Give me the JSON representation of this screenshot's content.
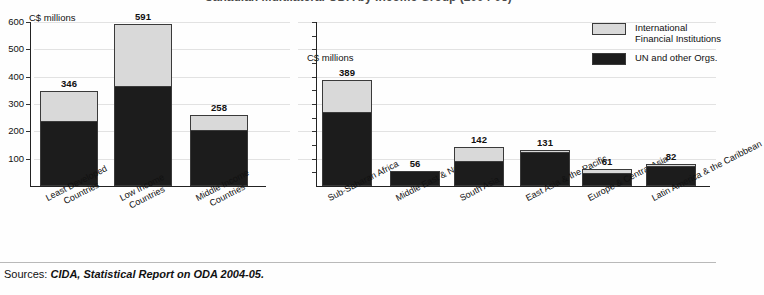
{
  "figure": {
    "title_cut_off": "Canadian Multilateral ODA by Income Group (2004-05)",
    "source_label": "Sources:",
    "source_reference": "CIDA, Statistical Report on ODA 2004-05."
  },
  "legend": {
    "position": "top-right",
    "items": [
      {
        "label_line1": "International",
        "label_line2": "Financial Institutions",
        "color": "#d9d9d9",
        "name": "international-financial-institutions"
      },
      {
        "label_line1": "UN and other Orgs.",
        "label_line2": "",
        "color": "#1c1c1c",
        "name": "un-and-other-orgs"
      }
    ]
  },
  "chart_data": [
    {
      "id": "income-group",
      "type": "bar",
      "stacked": true,
      "title": "",
      "xlabel": "",
      "ylabel": "C$ millions",
      "axis_unit": "C$ millions",
      "ylim": [
        0,
        600
      ],
      "yticks": [
        100,
        200,
        300,
        400,
        500,
        600
      ],
      "ytick_labels": [
        "100",
        "200",
        "300",
        "400",
        "500",
        "600"
      ],
      "grid": true,
      "categories": [
        "Least Developed Countries",
        "Low Income Countries",
        "Middle Income Countries"
      ],
      "category_lines": [
        [
          "Least Developed",
          "Countries"
        ],
        [
          "Low Income",
          "Countries"
        ],
        [
          "Middle Income",
          "Countries"
        ]
      ],
      "totals": [
        346,
        591,
        258
      ],
      "series": [
        {
          "name": "UN and other Orgs.",
          "color": "#1c1c1c",
          "values": [
            232,
            357,
            196
          ]
        },
        {
          "name": "International Financial Institutions",
          "color": "#d9d9d9",
          "values": [
            114,
            234,
            62
          ]
        }
      ]
    },
    {
      "id": "region",
      "type": "bar",
      "stacked": true,
      "title": "",
      "xlabel": "",
      "ylabel": "C$ millions",
      "axis_unit": "C$ millions",
      "ylim": [
        0,
        600
      ],
      "yticks": [
        100,
        200,
        300,
        400,
        500,
        600
      ],
      "ytick_labels": [
        "",
        "",
        "",
        "",
        "",
        ""
      ],
      "grid": true,
      "categories": [
        "Sub-Saharan Africa",
        "Middle East & North Africa",
        "South Asia",
        "East Asia & the Pacific",
        "Europe & Central Asia",
        "Latin America & the Caribbean"
      ],
      "category_lines": [
        [
          "Sub-Saharan Africa"
        ],
        [
          "Middle East & North Africa"
        ],
        [
          "South Asia"
        ],
        [
          "East Asia & the Pacific"
        ],
        [
          "Europe & Central Asia"
        ],
        [
          "Latin America & the Caribbean"
        ]
      ],
      "totals": [
        389,
        56,
        142,
        131,
        61,
        82
      ],
      "series": [
        {
          "name": "UN and other Orgs.",
          "color": "#1c1c1c",
          "values": [
            262,
            48,
            85,
            116,
            42,
            66
          ]
        },
        {
          "name": "International Financial Institutions",
          "color": "#d9d9d9",
          "values": [
            127,
            8,
            57,
            15,
            19,
            16
          ]
        }
      ]
    }
  ]
}
